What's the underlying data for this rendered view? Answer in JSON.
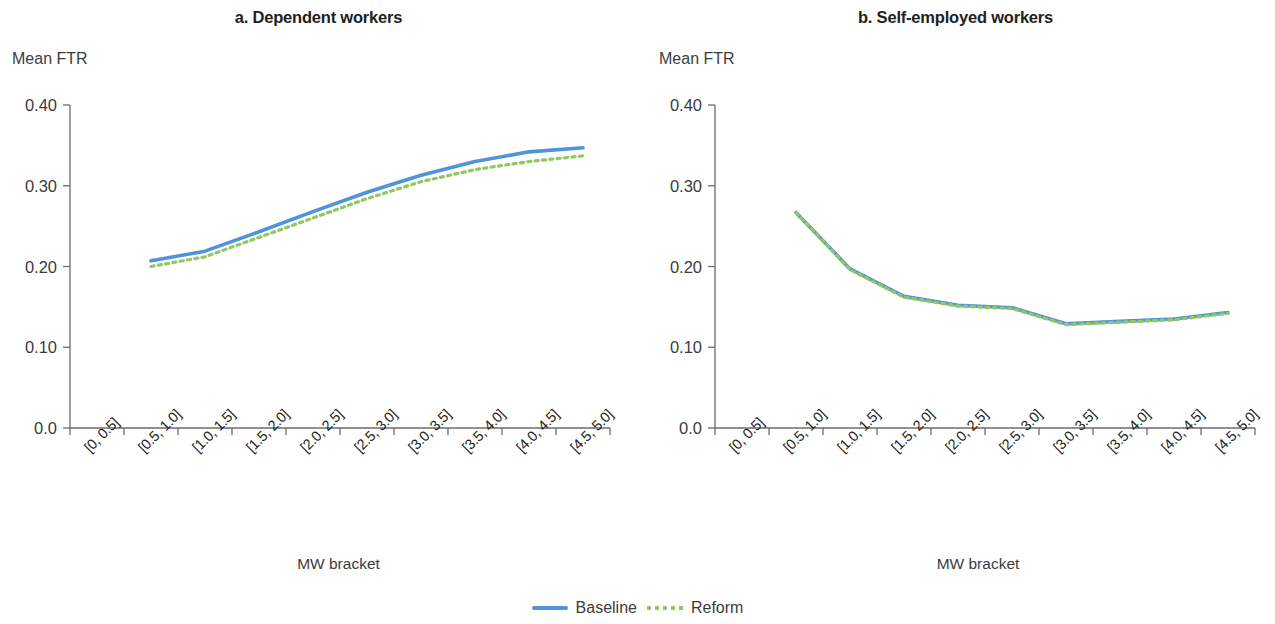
{
  "figure": {
    "legend": {
      "items": [
        {
          "label": "Baseline",
          "style": "solid",
          "color": "#4f93db"
        },
        {
          "label": "Reform",
          "style": "dotted",
          "color": "#92c765"
        }
      ]
    }
  },
  "panels": [
    {
      "id": "a",
      "title": "a. Dependent workers",
      "ylabel": "Mean FTR",
      "xlabel": "MW bracket"
    },
    {
      "id": "b",
      "title": "b. Self-employed workers",
      "ylabel": "Mean FTR",
      "xlabel": "MW bracket"
    }
  ],
  "chart_data": [
    {
      "type": "line",
      "title": "a. Dependent workers",
      "xlabel": "MW bracket",
      "ylabel": "Mean FTR",
      "categories": [
        "[0, 0.5]",
        "[0.5, 1.0]",
        "[1.0, 1.5]",
        "[1.5, 2.0]",
        "[2.0, 2.5]",
        "[2.5, 3.0]",
        "[3.0, 3.5]",
        "[3.5, 4.0]",
        "[4.0, 4.5]",
        "[4.5, 5.0]"
      ],
      "ylim": [
        0.0,
        0.4
      ],
      "yticks": [
        "0.0",
        "0.10",
        "0.20",
        "0.30",
        "0.40"
      ],
      "ytick_values": [
        0.0,
        0.1,
        0.2,
        0.3,
        0.4
      ],
      "grid": false,
      "legend_position": "bottom-center",
      "series": [
        {
          "name": "Baseline",
          "color": "#4f93db",
          "style": "solid",
          "values": [
            null,
            0.207,
            0.219,
            0.243,
            0.268,
            0.292,
            0.313,
            0.33,
            0.342,
            0.347
          ]
        },
        {
          "name": "Reform",
          "color": "#92c765",
          "style": "dotted",
          "values": [
            null,
            0.2,
            0.212,
            0.236,
            0.26,
            0.284,
            0.305,
            0.32,
            0.33,
            0.337
          ]
        }
      ]
    },
    {
      "type": "line",
      "title": "b. Self-employed workers",
      "xlabel": "MW bracket",
      "ylabel": "Mean FTR",
      "categories": [
        "[0, 0.5]",
        "[0.5, 1.0]",
        "[1.0, 1.5]",
        "[1.5, 2.0]",
        "[2.0, 2.5]",
        "[2.5, 3.0]",
        "[3.0, 3.5]",
        "[3.5, 4.0]",
        "[4.0, 4.5]",
        "[4.5, 5.0]"
      ],
      "ylim": [
        0.0,
        0.4
      ],
      "yticks": [
        "0.0",
        "0.10",
        "0.20",
        "0.30",
        "0.40"
      ],
      "ytick_values": [
        0.0,
        0.1,
        0.2,
        0.3,
        0.4
      ],
      "grid": false,
      "legend_position": "bottom-center",
      "series": [
        {
          "name": "Baseline",
          "color": "#4f93db",
          "style": "solid",
          "values": [
            null,
            0.267,
            0.197,
            0.163,
            0.152,
            0.149,
            0.129,
            0.132,
            0.135,
            0.143
          ]
        },
        {
          "name": "Reform",
          "color": "#92c765",
          "style": "dotted",
          "values": [
            null,
            0.267,
            0.196,
            0.162,
            0.151,
            0.148,
            0.128,
            0.131,
            0.134,
            0.142
          ]
        }
      ]
    }
  ]
}
